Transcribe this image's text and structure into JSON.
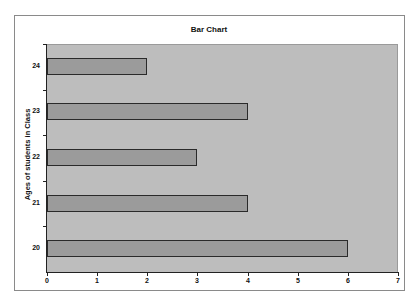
{
  "chart_data": {
    "type": "bar",
    "orientation": "horizontal",
    "title": "Bar Chart",
    "xlabel": "",
    "ylabel": "Ages of students in Class",
    "categories": [
      "20",
      "21",
      "22",
      "23",
      "24"
    ],
    "values": [
      6,
      4,
      3,
      4,
      2
    ],
    "xlim": [
      0,
      7
    ],
    "x_ticks": [
      "0",
      "1",
      "2",
      "3",
      "4",
      "5",
      "6",
      "7"
    ],
    "grid": false,
    "legend": null,
    "colors": {
      "bar": "#9b9b9b",
      "plot_background": "#bdbdbd",
      "bar_border": "#2a2a2a"
    }
  }
}
